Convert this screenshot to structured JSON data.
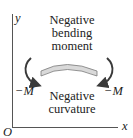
{
  "axes": {
    "y_label": "y",
    "x_label": "x",
    "origin_label": "O"
  },
  "title_lines": [
    "Negative",
    "bending",
    "moment"
  ],
  "left_moment_label": "−M",
  "right_moment_label": "−M",
  "curvature_lines": [
    "Negative",
    "curvature"
  ],
  "colors": {
    "beam_fill": "#d9d9d9",
    "beam_stroke": "#7a7a7a",
    "arrow": "#3a3a3a",
    "axis": "#555555",
    "text": "#222222"
  }
}
